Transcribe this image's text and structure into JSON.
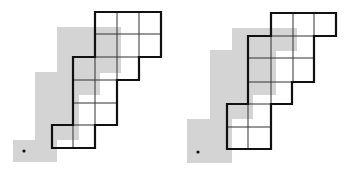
{
  "colors": {
    "background": "#ffffff",
    "shadow": "#d4d4d4",
    "outline": "#111111",
    "grid": "#333333",
    "dot": "#111111"
  },
  "figures": [
    {
      "name": "left-figure",
      "shadow_rects": [
        {
          "x": 57,
          "y": 27,
          "w": 64,
          "h": 46
        },
        {
          "x": 35,
          "y": 72,
          "w": 65,
          "h": 23
        },
        {
          "x": 35,
          "y": 95,
          "w": 44,
          "h": 45
        },
        {
          "x": 13,
          "y": 140,
          "w": 44,
          "h": 22
        }
      ],
      "dot": {
        "x": 24,
        "y": 151
      },
      "outline_points": "95,12 161,12 161,57 139,57 139,80 117,80 117,125 95,125 95,148 52,148 52,125 73,125 73,57 95,57",
      "grid_lines": [
        [
          95,
          34,
          161,
          34
        ],
        [
          117,
          12,
          117,
          57
        ],
        [
          139,
          12,
          139,
          57
        ],
        [
          95,
          57,
          139,
          57
        ],
        [
          95,
          57,
          95,
          125
        ],
        [
          117,
          57,
          117,
          80
        ],
        [
          73,
          80,
          117,
          80
        ],
        [
          73,
          103,
          117,
          103
        ],
        [
          73,
          125,
          95,
          125
        ],
        [
          73,
          125,
          73,
          148
        ]
      ]
    },
    {
      "name": "right-figure",
      "shadow_rects": [
        {
          "x": 232,
          "y": 28,
          "w": 65,
          "h": 23
        },
        {
          "x": 210,
          "y": 50,
          "w": 66,
          "h": 45
        },
        {
          "x": 210,
          "y": 95,
          "w": 43,
          "h": 24
        },
        {
          "x": 187,
          "y": 119,
          "w": 45,
          "h": 44
        }
      ],
      "dot": {
        "x": 198,
        "y": 152
      },
      "outline_points": "271,13 336,13 336,36 314,36 314,82 292,82 292,104 271,104 271,149 227,149 227,104 248,104 248,36 271,36",
      "grid_lines": [
        [
          293,
          13,
          293,
          82
        ],
        [
          314,
          13,
          314,
          36
        ],
        [
          271,
          36,
          314,
          36
        ],
        [
          248,
          58,
          314,
          58
        ],
        [
          248,
          82,
          314,
          82
        ],
        [
          271,
          36,
          271,
          104
        ],
        [
          248,
          104,
          271,
          104
        ],
        [
          227,
          127,
          271,
          127
        ],
        [
          248,
          104,
          248,
          149
        ]
      ]
    }
  ]
}
